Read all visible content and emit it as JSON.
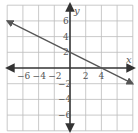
{
  "chart_data": {
    "type": "line",
    "title": "",
    "xlabel": "x",
    "ylabel": "y",
    "xlim": [
      -8,
      8
    ],
    "ylim": [
      -8,
      8
    ],
    "grid": true,
    "grid_step": 2,
    "x_ticks": [
      "-6",
      "-4",
      "-2",
      "2",
      "4"
    ],
    "y_ticks": [
      "6",
      "4",
      "2",
      "-2",
      "-4",
      "-6"
    ],
    "series": [
      {
        "name": "line",
        "equation": "y = -x/2 + 2",
        "x": [
          -8,
          0,
          4,
          8
        ],
        "y": [
          6,
          2,
          0,
          -2
        ]
      }
    ],
    "colors": {
      "grid": "#bbbbbb",
      "axes": "#333333",
      "line": "#555555"
    }
  }
}
